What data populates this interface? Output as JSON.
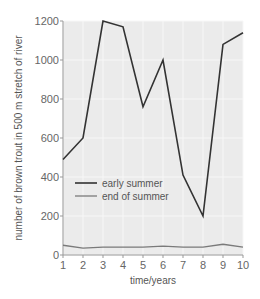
{
  "chart_data": {
    "type": "line",
    "title": "",
    "xlabel": "time/years",
    "ylabel": "number of brown trout in 500 m stretch of river",
    "x": [
      1,
      2,
      3,
      4,
      5,
      6,
      7,
      8,
      9,
      10
    ],
    "xticks": [
      "1",
      "2",
      "3",
      "4",
      "5",
      "6",
      "7",
      "8",
      "9",
      "10"
    ],
    "yticks": [
      "0",
      "200",
      "400",
      "600",
      "800",
      "1000",
      "1200"
    ],
    "xlim": [
      1,
      10
    ],
    "ylim": [
      0,
      1200
    ],
    "grid": true,
    "legend_position": "inside-left-middle",
    "series": [
      {
        "name": "early summer",
        "color": "#333333",
        "values": [
          490,
          600,
          1200,
          1170,
          760,
          1000,
          410,
          200,
          1080,
          1140
        ]
      },
      {
        "name": "end of summer",
        "color": "#7a7a7a",
        "values": [
          50,
          35,
          40,
          40,
          40,
          45,
          40,
          40,
          55,
          40
        ]
      }
    ]
  },
  "colors": {
    "plot_bg": "#ebebeb",
    "grid": "#f7f7f7",
    "axis": "#999999"
  }
}
